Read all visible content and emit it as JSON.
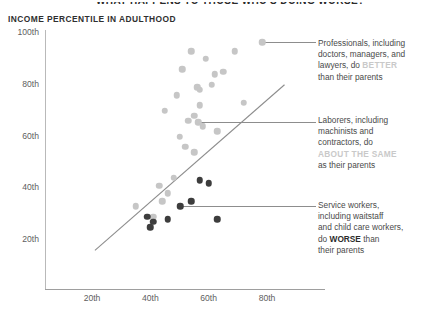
{
  "header": {
    "cut_off_title": "WHAT HAPPENS TO THOSE WHO'S DOING WORSE?",
    "y_axis_title": "INCOME PERCENTILE IN ADULTHOOD"
  },
  "annotations": [
    {
      "id": "professionals",
      "line1": "Professionals, including",
      "line2": "doctors, managers, and",
      "line3_pre": "lawyers, do ",
      "line3_em": "BETTER",
      "line4": "than their parents",
      "emphasis_style": "light",
      "anchor_x": 262,
      "anchor_y": 42
    },
    {
      "id": "laborers",
      "line1": "Laborers, including",
      "line2": "machinists and",
      "line3_pre": "contractors, do",
      "line3_em": "ABOUT THE SAME",
      "line4": "as their parents",
      "emphasis_style": "light",
      "anchor_x": 198,
      "anchor_y": 122
    },
    {
      "id": "service-workers",
      "line1": "Service workers,",
      "line2": "including waitstaff",
      "line3_pre": "and child care workers,",
      "line3_em": "WORSE",
      "line3_post": " than",
      "line4": "their parents",
      "emphasis_style": "dark",
      "anchor_x": 180,
      "anchor_y": 206
    }
  ],
  "colors": {
    "light_dot": "#c6c6c6",
    "dark_dot": "#3d3d3d",
    "axis": "#b9b9b9",
    "trend_line": "#8d8d8d",
    "text": "#4a4a4a"
  },
  "chart_data": {
    "type": "scatter",
    "title": "INCOME PERCENTILE IN ADULTHOOD",
    "xlabel": "",
    "ylabel": "Income percentile in adulthood",
    "xlim": [
      10,
      90
    ],
    "ylim": [
      10,
      100
    ],
    "xticks": [
      "20th",
      "40th",
      "60th",
      "80th"
    ],
    "xtick_values": [
      20,
      40,
      60,
      80
    ],
    "yticks": [
      "20th",
      "40th",
      "60th",
      "80th",
      "100th"
    ],
    "ytick_values": [
      20,
      40,
      60,
      80,
      100
    ],
    "grid": false,
    "legend": "none",
    "reference_line": {
      "label": "parity line",
      "x": [
        21,
        86
      ],
      "y": [
        16,
        80
      ]
    },
    "series": [
      {
        "name": "Higher-status occupations",
        "color": "#c6c6c6",
        "points": [
          [
            54,
            93
          ],
          [
            59,
            90
          ],
          [
            69,
            93
          ],
          [
            51,
            86
          ],
          [
            62,
            84
          ],
          [
            65,
            85
          ],
          [
            56,
            79
          ],
          [
            57,
            78
          ],
          [
            61,
            80
          ],
          [
            49,
            76
          ],
          [
            57,
            72
          ],
          [
            72,
            73
          ],
          [
            45,
            70
          ],
          [
            55,
            68
          ],
          [
            53,
            66
          ],
          [
            58,
            64
          ],
          [
            63,
            62
          ],
          [
            50,
            60
          ],
          [
            52,
            56
          ],
          [
            55,
            54
          ],
          [
            48,
            44
          ],
          [
            43,
            41
          ],
          [
            46,
            38
          ],
          [
            44,
            35
          ],
          [
            35,
            33
          ],
          [
            41,
            29
          ]
        ]
      },
      {
        "name": "Service occupations",
        "color": "#3d3d3d",
        "points": [
          [
            57,
            43
          ],
          [
            60,
            42
          ],
          [
            54,
            35
          ],
          [
            39,
            29
          ],
          [
            41,
            27
          ],
          [
            40,
            25
          ],
          [
            46,
            28
          ],
          [
            63,
            28
          ]
        ]
      }
    ]
  }
}
